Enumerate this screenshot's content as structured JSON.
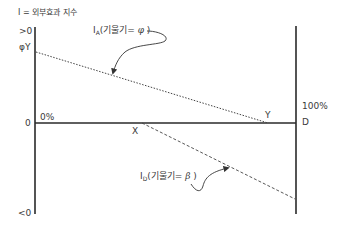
{
  "title": "I = 외부효과 지수",
  "axis_labels": {
    "top": ">0",
    "phiY": "φY",
    "zero": "0",
    "bottom": "<0",
    "zero_pct": "0%",
    "hundred_pct": "100%",
    "D": "D",
    "X": "X",
    "Y": "Y"
  },
  "line_A": {
    "prefix": "I",
    "subscript": "A",
    "text_open": "(기울기= ",
    "symbol": "φ",
    "text_close": " )"
  },
  "line_D": {
    "prefix": "I",
    "subscript": "D",
    "text_open": "(기울기= ",
    "symbol": "β",
    "text_close": " )"
  },
  "colors": {
    "axis": "#2a2a2a",
    "line": "#444444",
    "text": "#3a3a3a"
  }
}
